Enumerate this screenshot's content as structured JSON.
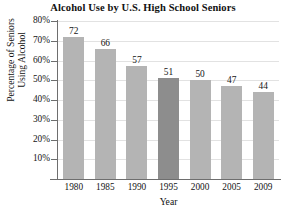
{
  "chart_data": {
    "type": "bar",
    "title": "Alcohol Use by U.S. High School Seniors",
    "xlabel": "Year",
    "ylabel_line1": "Percentage of Seniors",
    "ylabel_line2": "Using Alcohol",
    "categories": [
      "1980",
      "1985",
      "1990",
      "1995",
      "2000",
      "2005",
      "2009"
    ],
    "values": [
      72,
      66,
      57,
      51,
      50,
      47,
      44
    ],
    "value_labels": [
      "72",
      "66",
      "57",
      "51",
      "50",
      "47",
      "44"
    ],
    "ylim": [
      0,
      80
    ],
    "ytick_values": [
      80,
      70,
      60,
      50,
      40,
      30,
      20,
      10
    ],
    "ytick_labels": [
      "80%",
      "70%",
      "60%",
      "50%",
      "40%",
      "30%",
      "20%",
      "10%"
    ],
    "grid": true,
    "legend": null,
    "bar_colors": [
      "#b4b4b4",
      "#b4b4b4",
      "#b4b4b4",
      "#8d8d8d",
      "#b4b4b4",
      "#b4b4b4",
      "#b4b4b4"
    ],
    "highlighted_category": "1995",
    "colors": {
      "bar_default": "#b4b4b4",
      "bar_highlight": "#8d8d8d",
      "axis": "#6e6e6e",
      "gridline": "#e2e2e2",
      "text": "#141414",
      "background": "#ffffff"
    }
  }
}
